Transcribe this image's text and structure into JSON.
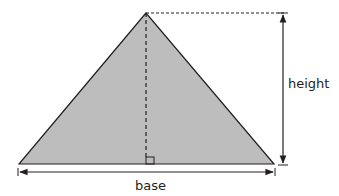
{
  "diagram": {
    "type": "triangle-area-diagram",
    "labels": {
      "height": "height",
      "base": "base"
    },
    "colors": {
      "fill": "#bdbdbd",
      "stroke": "#231f20",
      "background": "#ffffff"
    },
    "geometry": {
      "apex": [
        146,
        13
      ],
      "base_left": [
        19,
        164
      ],
      "base_right": [
        274,
        164
      ]
    }
  }
}
